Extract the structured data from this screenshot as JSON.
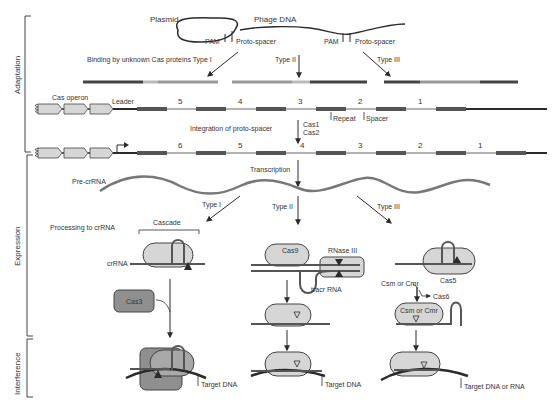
{
  "figure": {
    "stages": [
      {
        "label": "Adaptation",
        "y_top": 16,
        "y_bottom": 152
      },
      {
        "label": "Expression",
        "y_top": 156,
        "y_bottom": 338
      },
      {
        "label": "Interference",
        "y_top": 342,
        "y_bottom": 398
      }
    ]
  },
  "colors": {
    "line": "#2b2b2b",
    "repeat": "#555555",
    "spacer": "#9a9a9a",
    "protein_fill": "#d6d6d6",
    "protein_fill_dark": "#8f8f8f",
    "protein_stroke": "#444444",
    "text": "#333333"
  },
  "adaptation": {
    "plasmid_label": "Plasmid",
    "phage_label": "Phage DNA",
    "pam_label_1": "PAM",
    "protospacer_label_1": "Proto-spacer",
    "pam_label_2": "PAM",
    "protospacer_label_2": "Proto-spacer",
    "binding_label": "Binding by unknown Cas proteins Type I",
    "type2_label": "Type II",
    "type3_label": "Type III",
    "cas_operon_label": "Cas operon",
    "leader_label": "Leader",
    "array1_numbers": [
      "5",
      "4",
      "3",
      "2",
      "1"
    ],
    "repeat_label": "Repeat",
    "spacer_label": "Spacer",
    "integration_label": "Integration of proto-spacer",
    "cas1_label": "Cas1",
    "cas2_label": "Cas2",
    "array2_numbers": [
      "6",
      "5",
      "4",
      "3",
      "2",
      "1"
    ]
  },
  "expression": {
    "transcription_label": "Transcription",
    "pre_crrna_label": "Pre-crRNA",
    "type1_label": "Type I",
    "type2_label": "Type II",
    "type3_label": "Type III",
    "processing_label": "Processing to crRNA",
    "cascade_label": "Cascade",
    "crrna_label": "crRNA",
    "cas3_label": "Cas3",
    "cas9_label": "Cas9",
    "rnase3_label": "RNase III",
    "tracr_label": "tracr RNA",
    "cas5_label": "Cas5",
    "csm_cmr_label": "Csm or Cmr",
    "cas6_label": "Cas6",
    "csm_cmr_complex_label": "Csm or Cmr"
  },
  "interference": {
    "target1_label": "Target DNA",
    "target2_label": "Target DNA",
    "target3_label": "Target DNA or RNA"
  }
}
